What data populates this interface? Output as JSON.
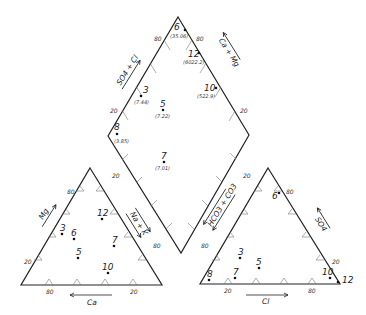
{
  "diagram": {
    "type": "piper-trilinear",
    "diamond": {
      "axis_labels": {
        "upper_left": "SO4 + Cl",
        "upper_right": "Ca + Mg"
      },
      "tick_labels": {
        "top_left": "80",
        "top_right": "80",
        "left_mid": "20",
        "right_mid": "20"
      },
      "points": [
        {
          "id": "6",
          "value": "(35.06)",
          "x": 180,
          "y": 31
        },
        {
          "id": "12",
          "value": "(6022.2)",
          "x": 199,
          "y": 54
        },
        {
          "id": "10",
          "value": "(522.9)",
          "x": 214,
          "y": 89
        },
        {
          "id": "3",
          "value": "(7.44)",
          "x": 142,
          "y": 96
        },
        {
          "id": "5",
          "value": "(7.22)",
          "x": 164,
          "y": 110
        },
        {
          "id": "8",
          "value": "(3.85)",
          "x": 117,
          "y": 134
        },
        {
          "id": "7",
          "value": "(7.01)",
          "x": 164,
          "y": 163
        }
      ]
    },
    "cation_triangle": {
      "axis_labels": {
        "left": "Mg",
        "right": "Na + K",
        "bottom": "Ca"
      },
      "tick_labels": {
        "left_top": "80",
        "left_bottom": "20",
        "right_top": "20",
        "right_bottom": "80",
        "bottom_left": "80",
        "bottom_right": "20"
      },
      "points": [
        {
          "id": "3",
          "x": 61,
          "y": 234
        },
        {
          "id": "6",
          "x": 73,
          "y": 239
        },
        {
          "id": "12",
          "x": 102,
          "y": 219
        },
        {
          "id": "7",
          "x": 114,
          "y": 246
        },
        {
          "id": "5",
          "x": 78,
          "y": 258
        },
        {
          "id": "10",
          "x": 108,
          "y": 273
        }
      ]
    },
    "anion_triangle": {
      "axis_labels": {
        "left": "HCO3 + CO3",
        "right": "SO4",
        "bottom": "Cl"
      },
      "tick_labels": {
        "left_top": "20",
        "left_bottom": "80",
        "right_top": "80",
        "right_bottom": "20",
        "bottom_left": "20",
        "bottom_right": "80"
      },
      "points": [
        {
          "id": "6",
          "x": 278,
          "y": 194
        },
        {
          "id": "3",
          "x": 240,
          "y": 258
        },
        {
          "id": "5",
          "x": 259,
          "y": 268
        },
        {
          "id": "8",
          "x": 209,
          "y": 280
        },
        {
          "id": "7",
          "x": 235,
          "y": 278
        },
        {
          "id": "10",
          "x": 330,
          "y": 278
        },
        {
          "id": "12",
          "x": 337,
          "y": 282
        }
      ]
    }
  }
}
